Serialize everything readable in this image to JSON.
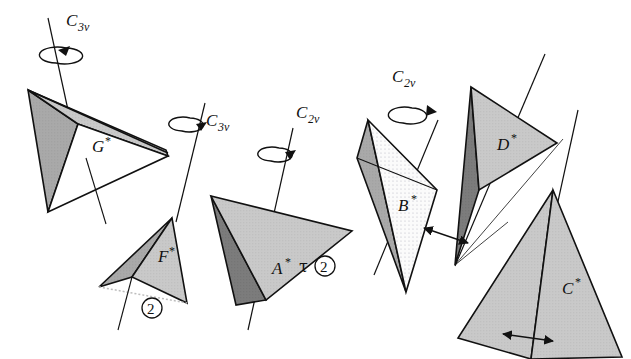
{
  "figure": {
    "background_color": "#ffffff",
    "line_color": "#111111",
    "width": 631,
    "height": 359
  },
  "shapes": [
    {
      "id": "G",
      "label": "G",
      "star": "*",
      "label_x": 92,
      "label_y": 146,
      "description": "tetrahedron with dark left face, mid-gray top face and white front face",
      "faces": [
        {
          "name": "left-face",
          "fill": "#9a9a9a",
          "points": "28,90 77,124 48,211"
        },
        {
          "name": "top-face",
          "fill": "#b9b9b9",
          "points": "28,90 77,124 168,157 ,  "
        },
        {
          "name": "front-face",
          "fill": "#ffffff",
          "points": "77,124 168,157 48,211"
        }
      ]
    },
    {
      "id": "F",
      "label": "F",
      "star": "*",
      "label_x": 161,
      "label_y": 256,
      "description": "narrow tetrahedron, dark-gray left face and mid-gray right face",
      "faces": [
        {
          "name": "left-face",
          "fill": "#8e8e8e",
          "points": "172,218 100,287 131,277"
        },
        {
          "name": "right-face",
          "fill": "#b0b0b0",
          "points": "172,218 131,277 186,302"
        }
      ]
    },
    {
      "id": "A",
      "label": "A",
      "star": "*",
      "label_x": 277,
      "label_y": 268,
      "description": "large tetrahedron, dark narrow left sliver and large light-gray main face",
      "faces": [
        {
          "name": "left-face",
          "fill": "#7a7a7a",
          "points": "211,195 236,305 266,300"
        },
        {
          "name": "main-face",
          "fill": "#c9c9c9",
          "points": "211,195 352,230 266,300"
        }
      ]
    },
    {
      "id": "B",
      "label": "B",
      "star": "*",
      "label_x": 403,
      "label_y": 205,
      "description": "thin kite, gray left face and very light dotted right face",
      "faces": [
        {
          "name": "left-face",
          "fill": "#a8a8a8",
          "points": "368,120 358,158 405,292"
        },
        {
          "name": "right-face",
          "fill": "#f2f2f2",
          "points": "368,120 437,190 405,292"
        }
      ]
    },
    {
      "id": "D",
      "label": "D",
      "star": "*",
      "label_x": 501,
      "label_y": 144,
      "description": "tetrahedron with dark narrow left sliver and light-gray top face",
      "faces": [
        {
          "name": "left-face",
          "fill": "#6f6f6f",
          "points": "471,87 455,265 478,190"
        },
        {
          "name": "top-face",
          "fill": "#c4c4c4",
          "points": "471,87 556,142 478,190"
        }
      ]
    },
    {
      "id": "C",
      "label": "C",
      "star": "*",
      "label_x": 568,
      "label_y": 288,
      "description": "tetrahedron with two light-gray faces of slightly different tone",
      "faces": [
        {
          "name": "left-face",
          "fill": "#c0c0c0",
          "points": "553,190 458,338 530,360"
        },
        {
          "name": "right-face",
          "fill": "#cbcbcb",
          "points": "553,190 530,360 620,358"
        }
      ]
    }
  ],
  "axis_labels": [
    {
      "id": "c3v-left",
      "main": "C",
      "sub": "3v",
      "x": 52,
      "y": 26
    },
    {
      "id": "c3v-mid",
      "main": "C",
      "sub": "3v",
      "x": 209,
      "y": 126
    },
    {
      "id": "c2v-mid",
      "main": "C",
      "sub": "2v",
      "x": 298,
      "y": 118
    },
    {
      "id": "c2v-right",
      "main": "C",
      "sub": "2v",
      "x": 394,
      "y": 82
    }
  ],
  "annotations": [
    {
      "id": "tau-circled-2",
      "tau": "τ",
      "number": "2",
      "x": 302,
      "y": 268
    },
    {
      "id": "circled-2-f",
      "tau": "",
      "number": "2",
      "x": 150,
      "y": 312
    }
  ],
  "legend": {
    "rotation_arrow_name": "curved-rotation-arrow",
    "double_arrow_name": "double-headed-arrow",
    "axis_line_name": "symmetry-axis-line"
  }
}
